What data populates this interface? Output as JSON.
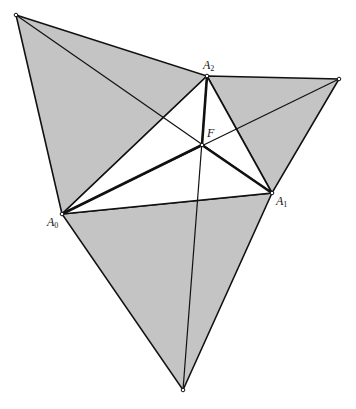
{
  "diagram": {
    "fill_color": "#c4c4c4",
    "stroke_color": "#111111",
    "points": {
      "A0": {
        "x": 62,
        "y": 214,
        "label": "A",
        "sub": "0"
      },
      "A1": {
        "x": 272,
        "y": 193,
        "label": "A",
        "sub": "1"
      },
      "A2": {
        "x": 207,
        "y": 76,
        "label": "A",
        "sub": "2"
      },
      "F": {
        "x": 202,
        "y": 145,
        "label": "F"
      },
      "P_top_left": {
        "x": 16,
        "y": 15
      },
      "P_right": {
        "x": 339,
        "y": 79
      },
      "P_bottom": {
        "x": 183,
        "y": 390
      }
    },
    "labels": {
      "a0": "A",
      "a0_sub": "0",
      "a1": "A",
      "a1_sub": "1",
      "a2": "A",
      "a2_sub": "2",
      "f": "F"
    }
  }
}
